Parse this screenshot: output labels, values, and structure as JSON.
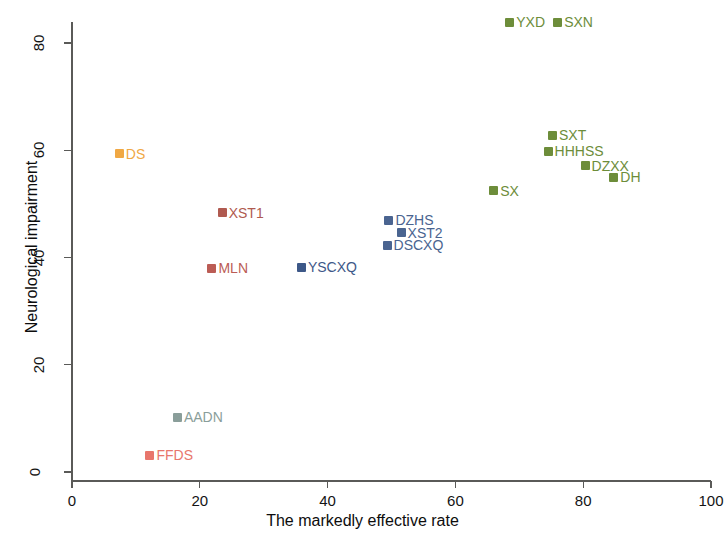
{
  "chart_data": {
    "type": "scatter",
    "title": "",
    "xlabel": "The markedly effective rate",
    "ylabel": "Neurological impairment",
    "xlim": [
      0,
      100
    ],
    "ylim": [
      0,
      87
    ],
    "xticks": [
      0,
      20,
      40,
      60,
      80,
      100
    ],
    "yticks": [
      0,
      20,
      40,
      60,
      80
    ],
    "grid": false,
    "legend": "none (points labelled in place)",
    "points": [
      {
        "label": "DS",
        "x": 7.4,
        "y": 59.7,
        "color": "#f0a844",
        "label_side": "right"
      },
      {
        "label": "XST1",
        "x": 23.5,
        "y": 48.7,
        "color": "#b05a50",
        "label_side": "right"
      },
      {
        "label": "MLN",
        "x": 21.9,
        "y": 38.4,
        "color": "#bb5c55",
        "label_side": "right"
      },
      {
        "label": "YSCXQ",
        "x": 35.9,
        "y": 38.6,
        "color": "#3d5888",
        "label_side": "right"
      },
      {
        "label": "AADN",
        "x": 16.5,
        "y": 10.6,
        "color": "#8a9e9a",
        "label_side": "right"
      },
      {
        "label": "FFDS",
        "x": 12.2,
        "y": 3.5,
        "color": "#e8766c",
        "label_side": "right"
      },
      {
        "label": "DZHS",
        "x": 49.6,
        "y": 47.3,
        "color": "#4a6490",
        "label_side": "right"
      },
      {
        "label": "XST2",
        "x": 51.5,
        "y": 45.0,
        "color": "#4a6490",
        "label_side": "right"
      },
      {
        "label": "DSCXQ",
        "x": 49.3,
        "y": 42.7,
        "color": "#4a6490",
        "label_side": "right"
      },
      {
        "label": "SX",
        "x": 66.0,
        "y": 52.8,
        "color": "#6d8d3a",
        "label_side": "right"
      },
      {
        "label": "YXD",
        "x": 68.5,
        "y": 84.2,
        "color": "#6d8d3a",
        "label_side": "right"
      },
      {
        "label": "SXN",
        "x": 76.0,
        "y": 84.2,
        "color": "#6d8d3a",
        "label_side": "right"
      },
      {
        "label": "SXT",
        "x": 75.2,
        "y": 63.2,
        "color": "#6d8d3a",
        "label_side": "right"
      },
      {
        "label": "HHHSS",
        "x": 74.5,
        "y": 60.2,
        "color": "#6d8d3a",
        "label_side": "right"
      },
      {
        "label": "DZXX",
        "x": 80.3,
        "y": 57.5,
        "color": "#6d8d3a",
        "label_side": "right"
      },
      {
        "label": "DH",
        "x": 84.8,
        "y": 55.3,
        "color": "#6d8d3a",
        "label_side": "right"
      }
    ]
  },
  "axes": {
    "x": {
      "title": "The markedly effective rate",
      "tick_labels": [
        "0",
        "20",
        "40",
        "60",
        "80",
        "100"
      ]
    },
    "y": {
      "title": "Neurological impairment",
      "tick_labels": [
        "0",
        "20",
        "40",
        "60",
        "80"
      ]
    }
  }
}
